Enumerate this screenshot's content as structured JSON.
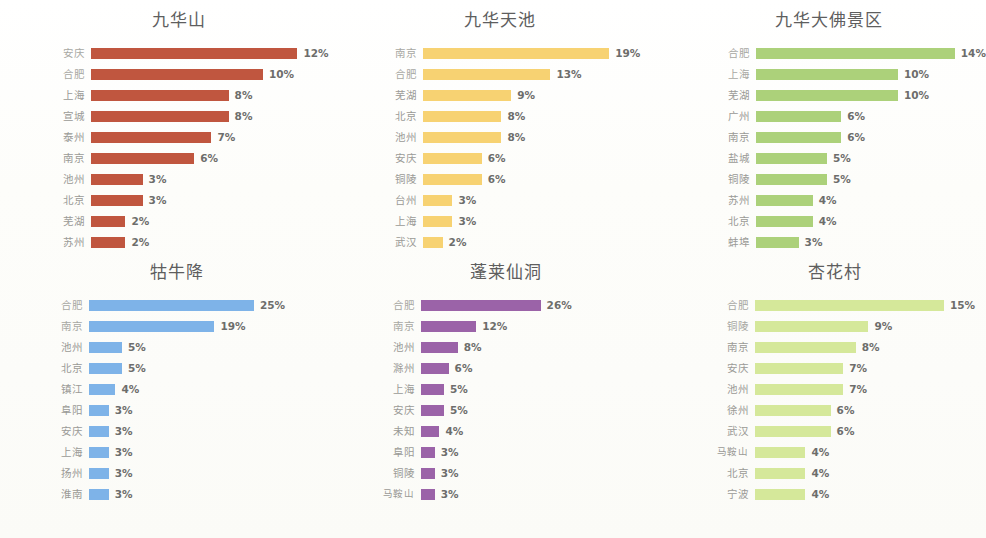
{
  "page": {
    "background_color": "#fdfdfb",
    "layout": "2 rows x 3 columns of horizontal bar charts"
  },
  "chart_data": [
    {
      "type": "bar",
      "orientation": "horizontal",
      "title": "九华山",
      "xlabel": "",
      "ylabel": "",
      "value_suffix": "%",
      "color": "#C0563F",
      "px_per_unit": 17.2,
      "categories": [
        "安庆",
        "合肥",
        "上海",
        "宣城",
        "泰州",
        "南京",
        "池州",
        "北京",
        "芜湖",
        "苏州"
      ],
      "values": [
        12,
        10,
        8,
        8,
        7,
        6,
        3,
        3,
        2,
        2
      ],
      "value_labels": [
        "12%",
        "10%",
        "8%",
        "8%",
        "7%",
        "6%",
        "3%",
        "3%",
        "2%",
        "2%"
      ]
    },
    {
      "type": "bar",
      "orientation": "horizontal",
      "title": "九华天池",
      "xlabel": "",
      "ylabel": "",
      "value_suffix": "%",
      "color": "#F7D272",
      "px_per_unit": 9.8,
      "categories": [
        "南京",
        "合肥",
        "芜湖",
        "北京",
        "池州",
        "安庆",
        "铜陵",
        "台州",
        "上海",
        "武汉"
      ],
      "values": [
        19,
        13,
        9,
        8,
        8,
        6,
        6,
        3,
        3,
        2
      ],
      "value_labels": [
        "19%",
        "13%",
        "9%",
        "8%",
        "8%",
        "6%",
        "6%",
        "3%",
        "3%",
        "2%"
      ]
    },
    {
      "type": "bar",
      "orientation": "horizontal",
      "title": "九华大佛景区",
      "xlabel": "",
      "ylabel": "",
      "value_suffix": "%",
      "color": "#ACD17A",
      "px_per_unit": 14.2,
      "categories": [
        "合肥",
        "上海",
        "芜湖",
        "广州",
        "南京",
        "盐城",
        "铜陵",
        "苏州",
        "北京",
        "蚌埠"
      ],
      "values": [
        14,
        10,
        10,
        6,
        6,
        5,
        5,
        4,
        4,
        3
      ],
      "value_labels": [
        "14%",
        "10%",
        "10%",
        "6%",
        "6%",
        "5%",
        "5%",
        "4%",
        "4%",
        "3%"
      ]
    },
    {
      "type": "bar",
      "orientation": "horizontal",
      "title": "牯牛降",
      "xlabel": "",
      "ylabel": "",
      "value_suffix": "%",
      "color": "#7EB3E8",
      "px_per_unit": 6.6,
      "categories": [
        "合肥",
        "南京",
        "池州",
        "北京",
        "镇江",
        "阜阳",
        "安庆",
        "上海",
        "扬州",
        "淮南"
      ],
      "values": [
        25,
        19,
        5,
        5,
        4,
        3,
        3,
        3,
        3,
        3
      ],
      "value_labels": [
        "25%",
        "19%",
        "5%",
        "5%",
        "4%",
        "3%",
        "3%",
        "3%",
        "3%",
        "3%"
      ]
    },
    {
      "type": "bar",
      "orientation": "horizontal",
      "title": "蓬莱仙洞",
      "xlabel": "",
      "ylabel": "",
      "value_suffix": "%",
      "color": "#9B63A8",
      "px_per_unit": 4.6,
      "categories": [
        "合肥",
        "南京",
        "池州",
        "滁州",
        "上海",
        "安庆",
        "未知",
        "阜阳",
        "铜陵",
        "马鞍山"
      ],
      "values": [
        26,
        12,
        8,
        6,
        5,
        5,
        4,
        3,
        3,
        3
      ],
      "value_labels": [
        "26%",
        "12%",
        "8%",
        "6%",
        "5%",
        "5%",
        "4%",
        "3%",
        "3%",
        "3%"
      ]
    },
    {
      "type": "bar",
      "orientation": "horizontal",
      "title": "杏花村",
      "xlabel": "",
      "ylabel": "",
      "value_suffix": "%",
      "color": "#D5E89A",
      "px_per_unit": 12.6,
      "categories": [
        "合肥",
        "铜陵",
        "南京",
        "安庆",
        "池州",
        "徐州",
        "武汉",
        "马鞍山",
        "北京",
        "宁波"
      ],
      "values": [
        15,
        9,
        8,
        7,
        7,
        6,
        6,
        4,
        4,
        4
      ],
      "value_labels": [
        "15%",
        "9%",
        "8%",
        "7%",
        "7%",
        "6%",
        "6%",
        "4%",
        "4%",
        "4%"
      ]
    }
  ]
}
